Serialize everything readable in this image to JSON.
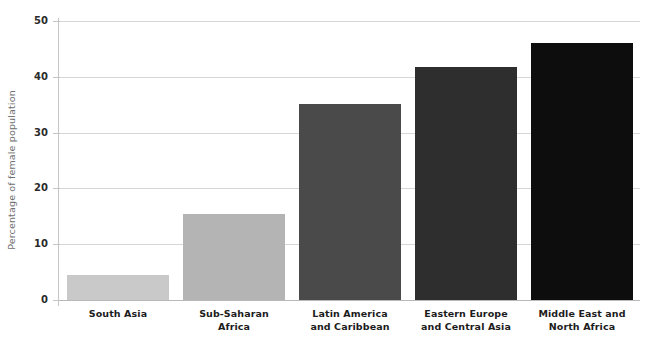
{
  "chart_data": {
    "type": "bar",
    "title": "",
    "subtitle": "",
    "xlabel": "",
    "ylabel": "Percentage of female population",
    "categories": [
      "South Asia",
      "Sub-Saharan Africa",
      "Latin America and Caribbean",
      "Eastern Europe and Central Asia",
      "Middle East and North Africa"
    ],
    "category_lines": [
      [
        "South Asia"
      ],
      [
        "Sub-Saharan",
        "Africa"
      ],
      [
        "Latin America",
        "and Caribbean"
      ],
      [
        "Eastern Europe",
        "and Central Asia"
      ],
      [
        "Middle East and",
        "North Africa"
      ]
    ],
    "values": [
      4.5,
      15.4,
      35.2,
      41.8,
      46.1
    ],
    "bar_colors": [
      "#c9c9c9",
      "#b4b4b4",
      "#4a4a4a",
      "#2e2e2e",
      "#0d0d0d"
    ],
    "ylim": [
      0,
      50
    ],
    "yticks": [
      0,
      10,
      20,
      30,
      40,
      50
    ],
    "ytick_labels": [
      "0",
      "10",
      "20",
      "30",
      "40",
      "50"
    ],
    "grid": true,
    "grid_axis": "y",
    "legend": "none",
    "background": "#ffffff",
    "grid_color": "#d6d6d6",
    "axis_color": "#c5c5c5",
    "tick_text_color": "#2b2b2b",
    "ylabel_color": "#6e6e6e"
  }
}
